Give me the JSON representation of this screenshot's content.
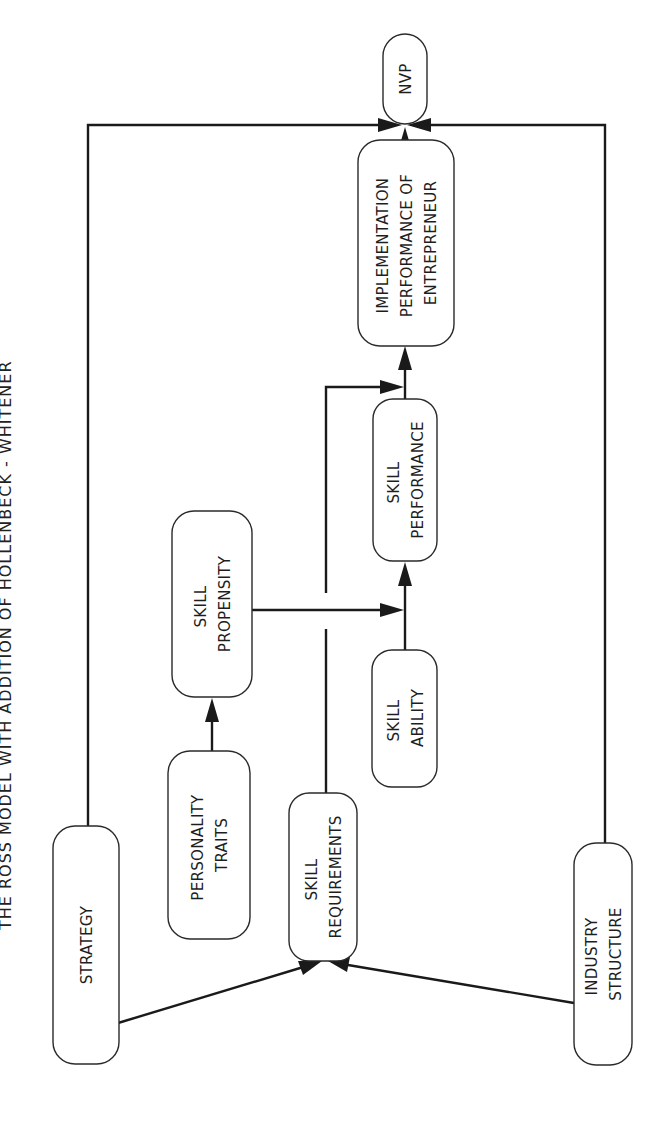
{
  "title": "THE ROSS MODEL WITH ADDITION OF HOLLENBECK - WHITENER",
  "nodes": {
    "nvp": {
      "lines": [
        "NVP"
      ]
    },
    "implementation": {
      "lines": [
        "IMPLEMENTATION",
        "PERFORMANCE OF",
        "ENTREPRENEUR"
      ]
    },
    "skill_performance": {
      "lines": [
        "SKILL",
        "PERFORMANCE"
      ]
    },
    "skill_propensity": {
      "lines": [
        "SKILL",
        "PROPENSITY"
      ]
    },
    "skill_ability": {
      "lines": [
        "SKILL",
        "ABILITY"
      ]
    },
    "personality_traits": {
      "lines": [
        "PERSONALITY",
        "TRAITS"
      ]
    },
    "skill_requirements": {
      "lines": [
        "SKILL",
        "REQUIREMENTS"
      ]
    },
    "strategy": {
      "lines": [
        "STRATEGY"
      ]
    },
    "industry_structure": {
      "lines": [
        "INDUSTRY",
        "STRUCTURE"
      ]
    }
  },
  "edges": [
    {
      "from": "strategy",
      "to": "nvp"
    },
    {
      "from": "industry_structure",
      "to": "nvp"
    },
    {
      "from": "implementation",
      "to": "nvp"
    },
    {
      "from": "skill_performance",
      "to": "implementation"
    },
    {
      "from": "skill_requirements",
      "to": "implementation"
    },
    {
      "from": "skill_propensity",
      "to": "skill_performance"
    },
    {
      "from": "skill_ability",
      "to": "skill_performance"
    },
    {
      "from": "personality_traits",
      "to": "skill_propensity"
    },
    {
      "from": "strategy",
      "to": "skill_requirements"
    },
    {
      "from": "industry_structure",
      "to": "skill_requirements"
    }
  ],
  "colors": {
    "line": "#1a1a1a",
    "box_stroke": "#2a2a2a",
    "background": "#ffffff"
  }
}
